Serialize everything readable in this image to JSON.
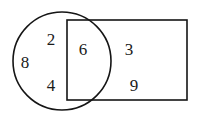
{
  "diagram": {
    "kind": "venn-diagram",
    "background_color": "#ffffff",
    "stroke_color": "#151515",
    "text_color": "#1a1a1a",
    "shapes": [
      {
        "name": "circle",
        "icon": "circle-outline-icon",
        "center_x": 62,
        "center_y": 61,
        "radius": 49
      },
      {
        "name": "rectangle",
        "icon": "rectangle-outline-icon",
        "x": 67,
        "y": 20,
        "width": 120,
        "height": 80
      }
    ],
    "regions": [
      {
        "name": "circle-only",
        "label": "circle only",
        "values": [
          "2",
          "8",
          "4"
        ]
      },
      {
        "name": "intersection",
        "label": "circle and rectangle",
        "values": [
          "6"
        ]
      },
      {
        "name": "rectangle-only",
        "label": "rectangle only",
        "values": [
          "3",
          "9"
        ]
      }
    ],
    "numbers": [
      {
        "value": "2",
        "x": 51,
        "y": 39,
        "region": "circle-only"
      },
      {
        "value": "8",
        "x": 25,
        "y": 62,
        "region": "circle-only"
      },
      {
        "value": "4",
        "x": 51,
        "y": 85,
        "region": "circle-only"
      },
      {
        "value": "6",
        "x": 83,
        "y": 49,
        "region": "intersection"
      },
      {
        "value": "3",
        "x": 129,
        "y": 49,
        "region": "rectangle-only"
      },
      {
        "value": "9",
        "x": 134,
        "y": 85,
        "region": "rectangle-only"
      }
    ]
  }
}
